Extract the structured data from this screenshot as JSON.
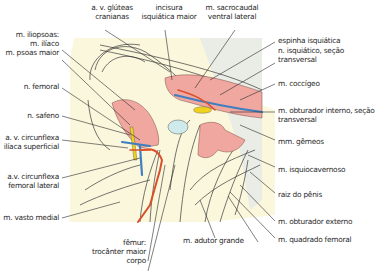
{
  "figure": {
    "type": "anatomical-illustration",
    "colors": {
      "background": "#fbf7dc",
      "shadow_bg": "#e4e6e6",
      "muscle": "#f0a7a0",
      "artery": "#d9502c",
      "vein": "#3f7fc0",
      "nerve": "#f0d21e",
      "cartilage": "#cfeaea",
      "line": "#333333"
    }
  },
  "labels": {
    "gluteal_vessels": [
      "a. v. glúteas",
      "cranianas"
    ],
    "greater_sciatic_notch": [
      "incisura",
      "isquiática maior"
    ],
    "sacrocaudal_muscle": [
      "m. sacrocaudal",
      "ventral lateral"
    ],
    "iliopsoas": [
      "m. iliopsoas:",
      "m. ilíaco",
      "m. psoas maior"
    ],
    "femoral_nerve": "n. femoral",
    "ischial_spine": "espinha isquiática",
    "sciatic_nerve": [
      "n. isquiático, seção",
      "transversal"
    ],
    "coccygeus": "m. coccígeo",
    "saphenous_nerve": "n. safeno",
    "internal_obturator": [
      "m. obturador interno, seção",
      "transversal"
    ],
    "superficial_circumflex_iliac": [
      "a. v. circunflexa",
      "ilíaca superficial"
    ],
    "gemelli": "mm. gêmeos",
    "lateral_circumflex_femoral": [
      "a.v. circunflexa",
      "femoral lateral"
    ],
    "ischiocavernosus": "m. isquiocavernoso",
    "vastus_medialis": "m. vasto medial",
    "penis_root": "raiz do pênis",
    "external_obturator": "m. obturador externo",
    "femur": [
      "fêmur:",
      "trocânter maior",
      "corpo"
    ],
    "adductor_magnus": "m. adutor grande",
    "quadratus_femoris": "m. quadrado femoral"
  }
}
